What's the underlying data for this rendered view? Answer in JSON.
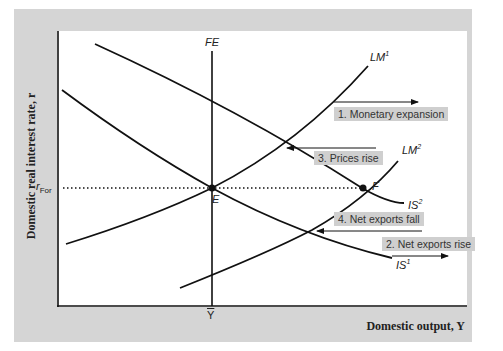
{
  "axes": {
    "y_label": "Domestic real interest rate, r",
    "x_label": "Domestic output, Y",
    "y_tick": "r",
    "y_tick_sub": "For",
    "x_tick": "Y"
  },
  "curves": {
    "fe": "FE",
    "lm1": "LM",
    "lm1_sup": "1",
    "lm2": "LM",
    "lm2_sup": "2",
    "is1": "IS",
    "is1_sup": "1",
    "is2": "IS",
    "is2_sup": "2"
  },
  "points": {
    "e": "E",
    "f": "F"
  },
  "annotations": [
    {
      "label": "1. Monetary expansion"
    },
    {
      "label": "2. Net exports rise"
    },
    {
      "label": "3. Prices rise"
    },
    {
      "label": "4. Net exports fall"
    }
  ],
  "colors": {
    "frame": "#d5d5d5",
    "label_box": "#cfcfcf",
    "line": "#111111"
  }
}
